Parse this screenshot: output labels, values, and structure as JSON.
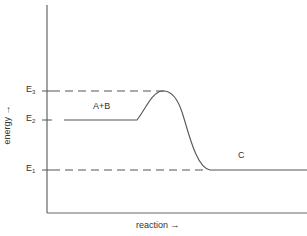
{
  "diagram": {
    "type": "energy-level-diagram",
    "axes": {
      "x_label": "reaction →",
      "y_label": "energy →"
    },
    "levels": [
      {
        "name": "E",
        "sub": "3",
        "role": "activation energy peak"
      },
      {
        "name": "E",
        "sub": "2",
        "role": "reactants level"
      },
      {
        "name": "E",
        "sub": "1",
        "role": "products level"
      }
    ],
    "species": {
      "reactants": "A+B",
      "products": "C"
    },
    "colors": {
      "line": "#555555",
      "text": "#333333"
    }
  }
}
